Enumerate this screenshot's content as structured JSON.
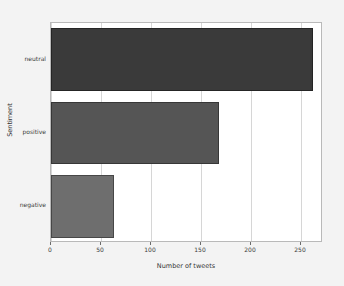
{
  "chart_data": {
    "type": "bar",
    "orientation": "horizontal",
    "title": "",
    "xlabel": "Number of tweets",
    "ylabel": "Sentiment",
    "categories": [
      "negative",
      "positive",
      "neutral"
    ],
    "values": [
      63,
      168,
      262
    ],
    "bars": [
      {
        "category": "neutral",
        "value": 262,
        "color": "#3a3a3a"
      },
      {
        "category": "positive",
        "value": 168,
        "color": "#555555"
      },
      {
        "category": "negative",
        "value": 63,
        "color": "#6e6e6e"
      }
    ],
    "xlim": [
      0,
      272
    ],
    "xticks": [
      0,
      50,
      100,
      150,
      200,
      250
    ],
    "xtick_labels": [
      "0",
      "50",
      "100",
      "150",
      "200",
      "250"
    ],
    "ytick_labels": [
      "neutral",
      "positive",
      "negative"
    ],
    "grid": {
      "x": true,
      "y": false,
      "color": "#d6d6d6"
    },
    "legend": null,
    "annotations": [],
    "style": {
      "figure_background": "#f3f3f3",
      "axes_background": "#ffffff",
      "frame_color": "#b9b9b9",
      "tick_color": "#6b6b6b",
      "text_color": "#333333"
    }
  }
}
